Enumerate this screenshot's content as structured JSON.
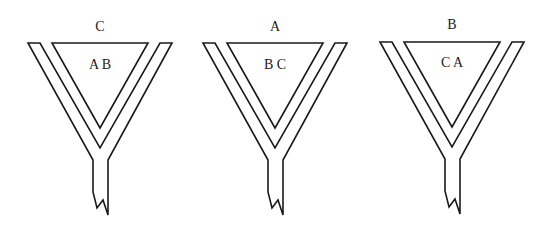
{
  "diagram": {
    "funnels": [
      {
        "top_label": "C",
        "inner_label": "A B",
        "offset_x": 0
      },
      {
        "top_label": "A",
        "inner_label": "B C",
        "offset_x": 175
      },
      {
        "top_label": "B",
        "inner_label": "C A",
        "offset_x": 352
      }
    ],
    "colors": {
      "stroke": "#1a1a1a",
      "background": "#ffffff"
    }
  }
}
